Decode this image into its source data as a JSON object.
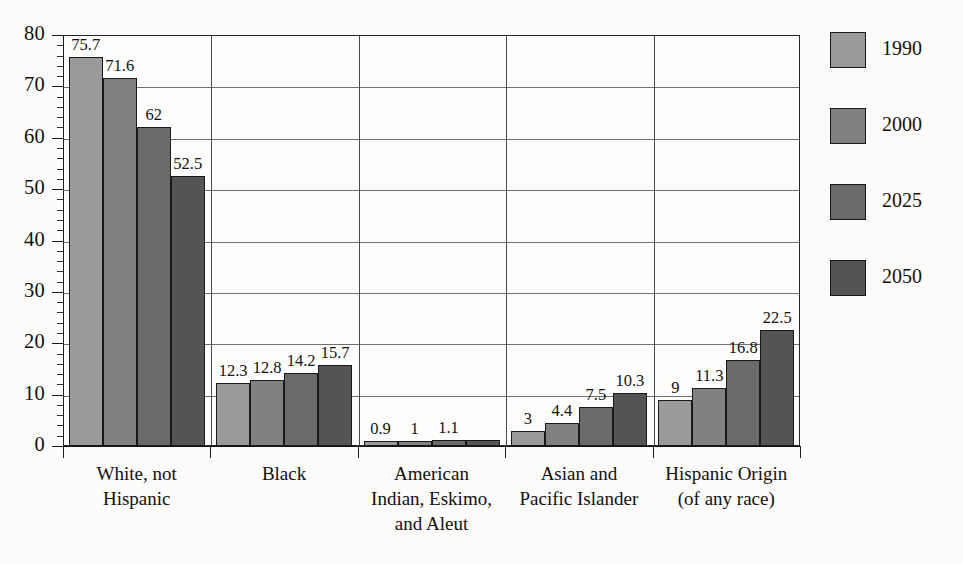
{
  "chart_data": {
    "type": "bar",
    "title": "",
    "subtitle": "",
    "xlabel": "",
    "ylabel": "",
    "ylim": [
      0,
      80
    ],
    "y_tick_step": 10,
    "y_minor_tick_step": 2,
    "grid": true,
    "legend_position": "right",
    "categories": [
      "White, not\nHispanic",
      "Black",
      "American\nIndian, Eskimo,\nand Aleut",
      "Asian and\nPacific Islander",
      "Hispanic Origin\n(of any race)"
    ],
    "y_tick_labels": [
      "0",
      "10",
      "20",
      "30",
      "40",
      "50",
      "60",
      "70",
      "80"
    ],
    "series": [
      {
        "name": "1990",
        "color": "#9a9a9a",
        "values": [
          75.7,
          12.3,
          0.9,
          3,
          9
        ]
      },
      {
        "name": "2000",
        "color": "#818181",
        "values": [
          71.6,
          12.8,
          1,
          4.4,
          11.3
        ]
      },
      {
        "name": "2025",
        "color": "#6a6a6a",
        "values": [
          62,
          14.2,
          1.1,
          7.5,
          16.8
        ]
      },
      {
        "name": "2050",
        "color": "#545454",
        "values": [
          52.5,
          15.7,
          1.1,
          10.3,
          22.5
        ]
      }
    ],
    "value_labels": [
      [
        "75.7",
        "71.6",
        "62",
        "52.5"
      ],
      [
        "12.3",
        "12.8",
        "14.2",
        "15.7"
      ],
      [
        "0.9",
        "1",
        "1.1",
        ""
      ],
      [
        "3",
        "4.4",
        "7.5",
        "10.3"
      ],
      [
        "9",
        "11.3",
        "16.8",
        "22.5"
      ]
    ]
  },
  "legend": {
    "items": [
      {
        "label": "1990"
      },
      {
        "label": "2000"
      },
      {
        "label": "2025"
      },
      {
        "label": "2050"
      }
    ]
  }
}
